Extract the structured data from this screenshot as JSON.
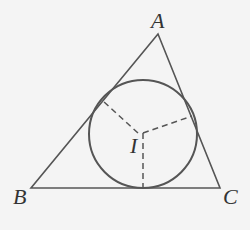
{
  "diagram": {
    "colors": {
      "line": "#555555",
      "background": "#f4f4f4",
      "text": "#333333"
    },
    "vertices": {
      "A": {
        "label": "A",
        "x": 158,
        "y": 34
      },
      "B": {
        "label": "B",
        "x": 31,
        "y": 188
      },
      "C": {
        "label": "C",
        "x": 220,
        "y": 188
      }
    },
    "incenter": {
      "label": "I",
      "x": 143,
      "y": 133
    },
    "incircle": {
      "cx": 143,
      "cy": 134,
      "r": 54
    },
    "tangent_points": [
      {
        "x": 103,
        "y": 100
      },
      {
        "x": 191,
        "y": 116
      },
      {
        "x": 143,
        "y": 188
      }
    ]
  }
}
